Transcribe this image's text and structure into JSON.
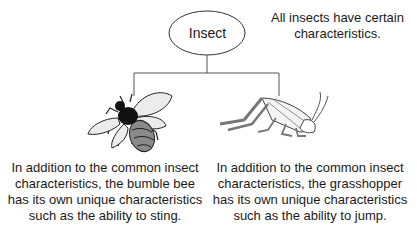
{
  "root": {
    "label": "Insect",
    "description": "All insects have certain characteristics."
  },
  "children": [
    {
      "name": "bumble bee",
      "icon": "bumble-bee-icon",
      "description": "In addition to the common insect characteristics, the bumble bee has its own unique characteristics such as the ability to sting."
    },
    {
      "name": "grasshopper",
      "icon": "grasshopper-icon",
      "description": "In addition to the common insect characteristics, the grasshopper has its own unique characteristics such as the ability to jump."
    }
  ],
  "colors": {
    "line": "#555555",
    "wing": "#e6e6e6",
    "body": "#8a8a8a",
    "dark": "#111111"
  }
}
